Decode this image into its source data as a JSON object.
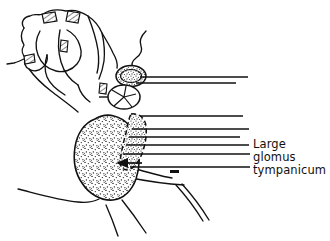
{
  "figure": {
    "kind": "anatomical-line-drawing",
    "background_color": "#ffffff",
    "ink_color": "#111111",
    "stipple_color": "#1a1a1a"
  },
  "annotations": [
    {
      "id": "glomus-label",
      "lines": [
        "Large",
        "glomus",
        "tympanicum"
      ],
      "line1": "Large",
      "line2": "glomus",
      "line3": "tympanicum",
      "x": 253,
      "y_line1": 144,
      "y_line2": 157,
      "y_line3": 170,
      "font_size_px": 11.5,
      "color": "#111111"
    }
  ],
  "leader_lines": [
    {
      "id": "leader-1",
      "x1": 140,
      "y1": 77,
      "x2": 248,
      "y2": 77
    },
    {
      "id": "leader-2",
      "x1": 136,
      "y1": 83,
      "x2": 236,
      "y2": 83
    },
    {
      "id": "leader-3",
      "x1": 140,
      "y1": 116,
      "x2": 243,
      "y2": 116
    },
    {
      "id": "leader-4",
      "x1": 132,
      "y1": 129,
      "x2": 249,
      "y2": 129
    },
    {
      "id": "leader-5",
      "x1": 129,
      "y1": 137,
      "x2": 240,
      "y2": 137
    },
    {
      "id": "leader-6",
      "x1": 126,
      "y1": 145,
      "x2": 249,
      "y2": 145
    },
    {
      "id": "leader-7",
      "x1": 123,
      "y1": 154,
      "x2": 250,
      "y2": 154
    },
    {
      "id": "leader-8",
      "x1": 130,
      "y1": 167,
      "x2": 250,
      "y2": 167
    }
  ],
  "markers": [
    {
      "id": "pointer-arrow",
      "type": "arrowhead-left",
      "tip_x": 118,
      "tip_y": 163
    },
    {
      "id": "dash-mark",
      "type": "short-dash",
      "x": 174,
      "y": 172,
      "width": 8
    }
  ],
  "structures": [
    {
      "id": "glomus-tumor-mass",
      "type": "stippled-mass",
      "description": "large stippled tumor mass"
    },
    {
      "id": "adjacent-stippled-band",
      "type": "stippled-band",
      "description": "elongated stippled structure right of mass"
    },
    {
      "id": "stippled-oval-upper",
      "type": "stippled-oval",
      "description": "small stippled oval at top"
    },
    {
      "id": "spoked-circle",
      "type": "radiating-circle",
      "description": "circle with radiating spokes"
    },
    {
      "id": "ossicular-arch",
      "type": "outline-arch",
      "description": "upper bony arch outline"
    },
    {
      "id": "joint-segment-left",
      "type": "hatched-box",
      "description": "hatched joint segment"
    },
    {
      "id": "joint-segment-right",
      "type": "hatched-box",
      "description": "hatched joint segment"
    },
    {
      "id": "lower-sweep-line",
      "type": "curve",
      "description": "long curve to base of mass"
    }
  ]
}
